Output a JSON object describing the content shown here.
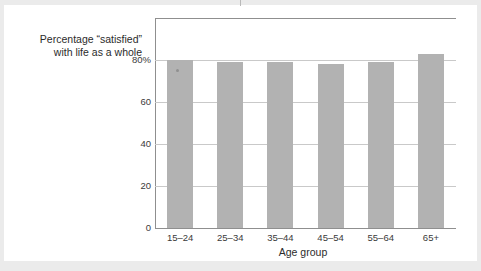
{
  "chart_data": {
    "type": "bar",
    "title": "",
    "categories": [
      "15–24",
      "25–34",
      "35–44",
      "45–54",
      "55–64",
      "65+"
    ],
    "values": [
      80,
      79,
      79,
      78,
      79,
      83
    ],
    "series": [
      {
        "name": "Percentage “satisfied” with life as a whole",
        "values": [
          80,
          79,
          79,
          78,
          79,
          83
        ]
      }
    ],
    "xlabel": "Age group",
    "ylabel_lines": [
      "Percentage “satisfied”",
      "with life as a whole"
    ],
    "ylim": [
      0,
      100
    ],
    "yticks": [
      0,
      20,
      40,
      60,
      80
    ],
    "ytick_labels": [
      "0",
      "20",
      "40",
      "60",
      "80%"
    ],
    "grid": true,
    "legend": "none",
    "bar_color": "#b2b2b2",
    "gridline_color": "#c9c9c9",
    "axis_color": "#8f8f8f"
  },
  "axes": {
    "y_title_line1": "Percentage “satisfied”",
    "y_title_line2": "with life as a whole",
    "x_title": "Age group"
  },
  "ticks": {
    "y": [
      "80%",
      "60",
      "40",
      "20",
      "0"
    ],
    "x": [
      "15–24",
      "25–34",
      "35–44",
      "45–54",
      "55–64",
      "65+"
    ]
  }
}
